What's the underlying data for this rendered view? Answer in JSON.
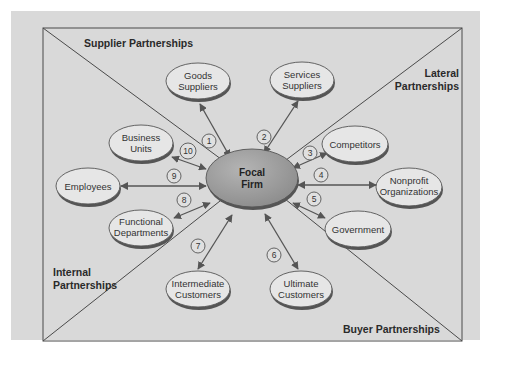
{
  "colors": {
    "page_background": "#ffffff",
    "panel_background": "#d9d9d9",
    "frame_stroke": "#4a4a4a",
    "node_fill": "#e6e6e6",
    "node_shadow": "#555555",
    "focal_fill": "#9a9a9a",
    "arrow": "#555555",
    "text": "#333333"
  },
  "regions": {
    "supplier": "Supplier Partnerships",
    "lateral_line1": "Lateral",
    "lateral_line2": "Partnerships",
    "internal_line1": "Internal",
    "internal_line2": "Partnerships",
    "buyer": "Buyer Partnerships"
  },
  "focal": {
    "line1": "Focal",
    "line2": "Firm"
  },
  "nodes": [
    {
      "id": "goods-suppliers",
      "line1": "Goods",
      "line2": "Suppliers",
      "number": "1"
    },
    {
      "id": "services-suppliers",
      "line1": "Services",
      "line2": "Suppliers",
      "number": "2"
    },
    {
      "id": "competitors",
      "line1": "Competitors",
      "line2": "",
      "number": "3"
    },
    {
      "id": "nonprofit-organizations",
      "line1": "Nonprofit",
      "line2": "Organizations",
      "number": "4"
    },
    {
      "id": "government",
      "line1": "Government",
      "line2": "",
      "number": "5"
    },
    {
      "id": "ultimate-customers",
      "line1": "Ultimate",
      "line2": "Customers",
      "number": "6"
    },
    {
      "id": "intermediate-customers",
      "line1": "Intermediate",
      "line2": "Customers",
      "number": "7"
    },
    {
      "id": "functional-departments",
      "line1": "Functional",
      "line2": "Departments",
      "number": "8"
    },
    {
      "id": "employees",
      "line1": "Employees",
      "line2": "",
      "number": "9"
    },
    {
      "id": "business-units",
      "line1": "Business",
      "line2": "Units",
      "number": "10"
    }
  ]
}
